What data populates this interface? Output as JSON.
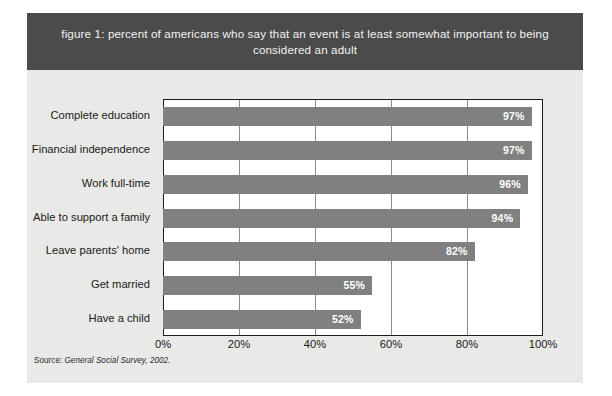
{
  "figure": {
    "title": "figure 1: percent of americans who say that an event is at least somewhat important to being considered an adult",
    "source_label": "Source:",
    "source_text": "General Social Survey, 2002."
  },
  "colors": {
    "title_band": "#4b4b4b",
    "title_text": "#f2f2f2",
    "card_background": "#e9e9e7",
    "plot_background": "#ffffff",
    "bar_fill": "#808080",
    "bar_label": "#ffffff",
    "axis_line": "#1d1d1d",
    "gridline": "#8c8c8c"
  },
  "chart_data": {
    "type": "bar",
    "orientation": "horizontal",
    "title": "figure 1: percent of americans who say that an event is at least somewhat important to being considered an adult",
    "xlabel": "",
    "ylabel": "",
    "categories": [
      "Complete education",
      "Financial independence",
      "Work full-time",
      "Able to support a family",
      "Leave parents' home",
      "Get married",
      "Have a child"
    ],
    "values": [
      97,
      97,
      96,
      94,
      82,
      55,
      52
    ],
    "value_labels": [
      "97%",
      "97%",
      "96%",
      "94%",
      "82%",
      "55%",
      "52%"
    ],
    "xlim": [
      0,
      100
    ],
    "xticks": [
      0,
      20,
      40,
      60,
      80,
      100
    ],
    "xticklabels": [
      "0%",
      "20%",
      "40%",
      "60%",
      "80%",
      "100%"
    ],
    "grid": true,
    "grid_axis": "x",
    "legend": false,
    "legend_position": "none"
  }
}
